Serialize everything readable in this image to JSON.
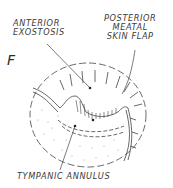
{
  "figure": {
    "letter": "F",
    "labels": {
      "anterior_exostosis": [
        "ANTERIOR",
        "EXOSTOSIS"
      ],
      "posterior_meatal_skin_flap": [
        "POSTERIOR",
        "MEATAL",
        "SKIN FLAP"
      ],
      "tympanic_annulus": "TYMPANIC ANNULUS"
    },
    "colors": {
      "ink": "#3a3a3a",
      "background": "#ffffff"
    }
  }
}
